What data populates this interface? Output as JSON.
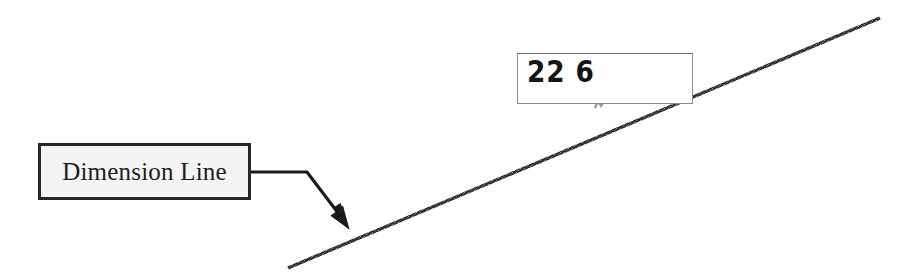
{
  "document": {
    "type": "technical-drawing-annotation",
    "background_color": "#ffffff",
    "width": 910,
    "height": 280
  },
  "callout": {
    "label": "Dimension Line",
    "box": {
      "x": 38,
      "y": 143,
      "width": 213,
      "height": 57
    },
    "border_color": "#272727",
    "fill_color": "#f4f4f4",
    "text_color": "#1d1d1d"
  },
  "leader": {
    "name": "leader-line-with-arrow",
    "color": "#1a1a1a",
    "segments": [
      {
        "x1": 251,
        "y1": 172,
        "x2": 307,
        "y2": 172
      },
      {
        "x1": 307,
        "y1": 172,
        "x2": 344,
        "y2": 221
      }
    ],
    "arrow_tip": {
      "x": 349,
      "y": 229
    }
  },
  "dimension_value": {
    "text": "22 6",
    "box": {
      "x": 517,
      "y": 53,
      "width": 176,
      "height": 51
    },
    "border_color": "#8d8d8d",
    "fill_color": "#ffffff",
    "text_color": "#151515"
  },
  "dimension_line": {
    "name": "dimension-line-diagonal",
    "color": "#2e2e2e",
    "start": {
      "x": 288,
      "y": 268
    },
    "end": {
      "x": 880,
      "y": 18
    },
    "stroke_width": 3,
    "texture": "stippled"
  },
  "artifact": {
    "name": "scan-artifact-mark",
    "x": 592,
    "y": 99
  }
}
